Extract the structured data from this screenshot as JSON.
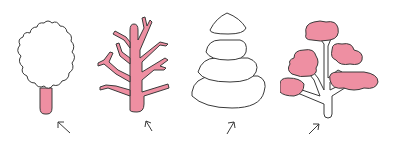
{
  "figure": {
    "colors": {
      "fill": "#ee8fa2",
      "stroke": "#3a3a3a",
      "background": "#ffffff"
    },
    "trees": [
      {
        "id": 1,
        "label": "Rounded crown tree",
        "highlight": "trunk",
        "arrow": "up-left"
      },
      {
        "id": 2,
        "label": "Bare branching tree",
        "highlight": "whole tree",
        "arrow": "up-left"
      },
      {
        "id": 3,
        "label": "Conical conifer tree",
        "highlight": "none",
        "arrow": "up-right"
      },
      {
        "id": 4,
        "label": "Tree with cloud-like foliage clumps",
        "highlight": "foliage",
        "arrow": "up-right"
      }
    ]
  }
}
